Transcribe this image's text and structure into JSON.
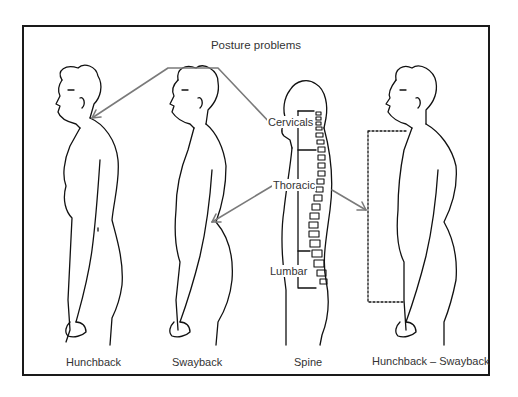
{
  "diagram": {
    "title": "Posture problems",
    "figures": [
      {
        "id": "hunchback",
        "caption": "Hunchback"
      },
      {
        "id": "swayback",
        "caption": "Swayback"
      },
      {
        "id": "spine",
        "caption": "Spine"
      },
      {
        "id": "hunchback-swayback",
        "caption": "Hunchback – Swayback"
      }
    ],
    "spine_regions": [
      {
        "label": "Cervicals"
      },
      {
        "label": "Thoracic"
      },
      {
        "label": "Lumbar"
      }
    ],
    "colors": {
      "line": "#111111",
      "arrow": "#7a7a7a",
      "frame": "#1a1a1a"
    }
  }
}
